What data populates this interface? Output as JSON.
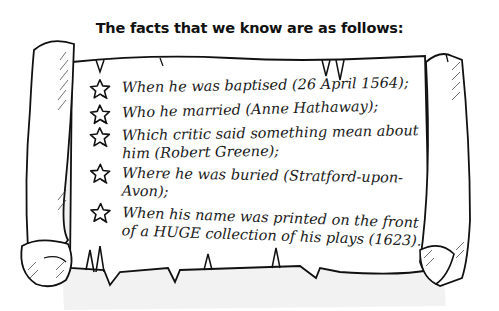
{
  "title": "The facts that we know are as follows:",
  "facts": [
    {
      "icon": "star-icon",
      "text": "When he was baptised (26 April 1564);"
    },
    {
      "icon": "star-icon",
      "text": "Who he married (Anne Hathaway);"
    },
    {
      "icon": "star-icon",
      "text": "Which critic said something mean about him (Robert Greene);"
    },
    {
      "icon": "star-icon",
      "text": "Where he was buried (Stratford-upon-Avon);"
    },
    {
      "icon": "star-icon",
      "text": "When his name was printed on the front of a HUGE collection of his plays (1623)."
    }
  ],
  "colors": {
    "ink": "#111111",
    "paper": "#ffffff",
    "shadow": "#9a9a9a"
  }
}
